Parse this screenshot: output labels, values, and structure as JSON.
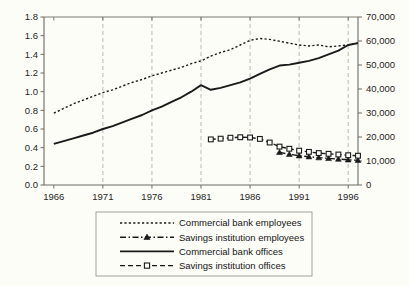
{
  "chart_data": {
    "type": "line",
    "title": "",
    "subtitle": "",
    "xlabel": "",
    "ylabel": "",
    "ylabel_right": "",
    "grid": true,
    "grid_orientation": "vertical-dashed",
    "legend_position": "bottom",
    "x": [
      1966,
      1967,
      1968,
      1969,
      1970,
      1971,
      1972,
      1973,
      1974,
      1975,
      1976,
      1977,
      1978,
      1979,
      1980,
      1981,
      1982,
      1983,
      1984,
      1985,
      1986,
      1987,
      1988,
      1989,
      1990,
      1991,
      1992,
      1993,
      1994,
      1995,
      1996,
      1997
    ],
    "xlim": [
      1965,
      1997
    ],
    "xticks": [
      1966,
      1971,
      1976,
      1981,
      1986,
      1991,
      1996
    ],
    "xtick_labels": [
      "1966",
      "1971",
      "1976",
      "1981",
      "1986",
      "1991",
      "1996"
    ],
    "ylim_left": [
      0.0,
      1.8
    ],
    "yticks_left": [
      0.0,
      0.2,
      0.4,
      0.6,
      0.8,
      1.0,
      1.2,
      1.4,
      1.6,
      1.8
    ],
    "ytick_labels_left": [
      "0.0",
      "0.2",
      "0.4",
      "0.6",
      "0.8",
      "1.0",
      "1.2",
      "1.4",
      "1.6",
      "1.8"
    ],
    "ylim_right": [
      0,
      70000
    ],
    "yticks_right": [
      0,
      10000,
      20000,
      30000,
      40000,
      50000,
      60000,
      70000
    ],
    "ytick_labels_right": [
      "0",
      "10,000",
      "20,000",
      "30,000",
      "40,000",
      "50,000",
      "60,000",
      "70,000"
    ],
    "series": [
      {
        "name": "Commercial bank employees",
        "key": "commercial-bank-employees",
        "axis": "left",
        "style": "dotted",
        "marker": "none",
        "color": "#1a1a1a",
        "x": [
          1966,
          1967,
          1968,
          1969,
          1970,
          1971,
          1972,
          1973,
          1974,
          1975,
          1976,
          1977,
          1978,
          1979,
          1980,
          1981,
          1982,
          1983,
          1984,
          1985,
          1986,
          1987,
          1988,
          1989,
          1990,
          1991,
          1992,
          1993,
          1994,
          1995,
          1996,
          1997
        ],
        "values": [
          0.77,
          0.82,
          0.87,
          0.91,
          0.95,
          0.99,
          1.02,
          1.06,
          1.1,
          1.13,
          1.17,
          1.2,
          1.23,
          1.26,
          1.3,
          1.33,
          1.38,
          1.42,
          1.45,
          1.5,
          1.55,
          1.57,
          1.56,
          1.54,
          1.52,
          1.5,
          1.49,
          1.5,
          1.48,
          1.49,
          1.5,
          1.52
        ]
      },
      {
        "name": "Savings institution employees",
        "key": "savings-institution-employees",
        "axis": "right",
        "style": "dash-dot",
        "marker": "filled-triangle",
        "color": "#1a1a1a",
        "x": [
          1989,
          1990,
          1991,
          1992,
          1993,
          1994,
          1995,
          1996,
          1997
        ],
        "values": [
          13600,
          12800,
          12200,
          11800,
          11400,
          11100,
          10800,
          10500,
          10300
        ]
      },
      {
        "name": "Commercial bank offices",
        "key": "commercial-bank-offices",
        "axis": "left",
        "style": "solid",
        "marker": "none",
        "color": "#1a1a1a",
        "x": [
          1966,
          1967,
          1968,
          1969,
          1970,
          1971,
          1972,
          1973,
          1974,
          1975,
          1976,
          1977,
          1978,
          1979,
          1980,
          1981,
          1982,
          1983,
          1984,
          1985,
          1986,
          1987,
          1988,
          1989,
          1990,
          1991,
          1992,
          1993,
          1994,
          1995,
          1996,
          1997
        ],
        "values": [
          0.44,
          0.47,
          0.5,
          0.53,
          0.56,
          0.6,
          0.63,
          0.67,
          0.71,
          0.75,
          0.8,
          0.84,
          0.89,
          0.94,
          1.0,
          1.07,
          1.02,
          1.04,
          1.07,
          1.1,
          1.14,
          1.19,
          1.24,
          1.28,
          1.29,
          1.31,
          1.33,
          1.36,
          1.4,
          1.44,
          1.5,
          1.52
        ]
      },
      {
        "name": "Savings institution offices",
        "key": "savings-institution-offices",
        "axis": "right",
        "style": "dashed",
        "marker": "open-square",
        "color": "#1a1a1a",
        "x": [
          1982,
          1983,
          1984,
          1985,
          1986,
          1987,
          1988,
          1989,
          1990,
          1991,
          1992,
          1993,
          1994,
          1995,
          1996,
          1997
        ],
        "values": [
          19000,
          19300,
          19700,
          19900,
          19800,
          19200,
          17700,
          16000,
          15100,
          14300,
          13800,
          13300,
          13000,
          12700,
          12400,
          12200
        ]
      }
    ]
  },
  "legend": {
    "items": [
      {
        "label": "Commercial bank employees",
        "key": "commercial-bank-employees"
      },
      {
        "label": "Savings institution employees",
        "key": "savings-institution-employees"
      },
      {
        "label": "Commercial bank offices",
        "key": "commercial-bank-offices"
      },
      {
        "label": "Savings institution offices",
        "key": "savings-institution-offices"
      }
    ]
  },
  "colors": {
    "ink": "#1a1a1a",
    "axis": "#6b6b63",
    "grid": "#a8a8a0",
    "background": "#fdfdf8"
  }
}
